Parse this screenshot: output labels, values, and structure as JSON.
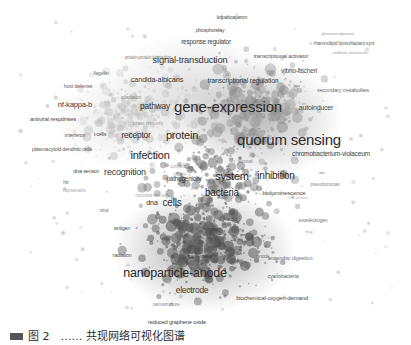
{
  "figure": {
    "kind": "term-co-occurrence-network",
    "background_color": "#ffffff",
    "node_color_light": "#c9c9c9",
    "node_color_mid": "#9a9a9a",
    "node_color_dark": "#5e5e5e",
    "label_color": "#2b2b2b",
    "caption": "图 2　…… 共现网络可视化图谱"
  },
  "chart_data": {
    "type": "scatter",
    "title": "",
    "subtitle": "",
    "xlabel": "",
    "ylabel": "",
    "xlim": [
      0,
      411
    ],
    "ylim": [
      0,
      318
    ],
    "grid": false,
    "legend": "none",
    "note": "Bibliometric VOSviewer-style term map: greyscale bubbles sized by occurrence, positioned by co-occurrence similarity. Three visually apparent density regions: a light upper-left immunology region, a mid-grey upper-right quorum-sensing region, and a dark lower central nanoparticle / electrode region.",
    "clusters": [
      {
        "name": "immunology-host-response",
        "shade": "light",
        "color": "#c9c9c9"
      },
      {
        "name": "quorum-sensing-gene-regulation",
        "shade": "mid",
        "color": "#9a9a9a"
      },
      {
        "name": "nanoparticle-electrode-bioelectrochemistry",
        "shade": "dark",
        "color": "#5e5e5e"
      }
    ],
    "labels": [
      {
        "text": "kdpabcaperon",
        "x": 232,
        "y": 18,
        "size": 5.2,
        "weight": 400,
        "opacity": 0.85,
        "cluster": 1
      },
      {
        "text": "phosphorelay",
        "x": 210,
        "y": 31,
        "size": 5.2,
        "weight": 400,
        "opacity": 0.85,
        "cluster": 1
      },
      {
        "text": "response regulator",
        "x": 206,
        "y": 42,
        "size": 6.4,
        "weight": 400,
        "opacity": 0.9,
        "cluster": 1
      },
      {
        "text": "protein-protein interaction",
        "x": 148,
        "y": 58,
        "size": 4.6,
        "weight": 400,
        "opacity": 0.55,
        "cluster": 0
      },
      {
        "text": "signal-transduction",
        "x": 190,
        "y": 60,
        "size": 9.4,
        "weight": 400,
        "opacity": 0.95,
        "cluster": 1
      },
      {
        "text": "transcriptional activator",
        "x": 281,
        "y": 57,
        "size": 5.8,
        "weight": 400,
        "opacity": 0.8,
        "cluster": 1
      },
      {
        "text": "pharmacodynamic",
        "x": 338,
        "y": 34,
        "size": 4.4,
        "weight": 400,
        "opacity": 0.45,
        "cluster": 1
      },
      {
        "text": "rhamnolipid biosurfactant synt",
        "x": 344,
        "y": 43,
        "size": 5.0,
        "weight": 400,
        "opacity": 0.75,
        "cluster": 1
      },
      {
        "text": "antibiotic treatments",
        "x": 350,
        "y": 53,
        "size": 4.4,
        "weight": 400,
        "opacity": 0.45,
        "cluster": 1
      },
      {
        "text": "flagellin",
        "x": 101,
        "y": 73,
        "size": 5.0,
        "weight": 400,
        "opacity": 0.7,
        "cluster": 0
      },
      {
        "text": "candida-albicans",
        "x": 157,
        "y": 80,
        "size": 7.4,
        "weight": 400,
        "opacity": 0.9,
        "cluster": 0
      },
      {
        "text": "transcriptional regulation",
        "x": 243,
        "y": 80,
        "size": 7.0,
        "weight": 400,
        "opacity": 0.9,
        "cluster": 1
      },
      {
        "text": "vibrio-fischeri",
        "x": 299,
        "y": 71,
        "size": 6.6,
        "weight": 400,
        "opacity": 0.85,
        "cluster": 1
      },
      {
        "text": "host defense",
        "x": 78,
        "y": 87,
        "size": 5.4,
        "weight": 400,
        "opacity": 0.75,
        "cluster": 0
      },
      {
        "text": "lasr",
        "x": 297,
        "y": 86,
        "size": 4.4,
        "weight": 400,
        "opacity": 0.6,
        "cluster": 1
      },
      {
        "text": "secondary metabolites",
        "x": 343,
        "y": 91,
        "size": 5.6,
        "weight": 400,
        "opacity": 0.7,
        "cluster": 1
      },
      {
        "text": "adaptation",
        "x": 131,
        "y": 98,
        "size": 4.8,
        "weight": 400,
        "opacity": 0.5,
        "cluster": 0
      },
      {
        "text": "nf-kappa-b",
        "x": 75,
        "y": 105,
        "size": 7.6,
        "weight": 400,
        "opacity": 0.92,
        "cluster": 0
      },
      {
        "text": "pathway",
        "x": 155,
        "y": 106,
        "size": 8.4,
        "weight": 400,
        "opacity": 0.95,
        "cluster": 0
      },
      {
        "text": "gene-expression",
        "x": 228,
        "y": 106,
        "size": 15.0,
        "weight": 400,
        "opacity": 1.0,
        "cluster": 1
      },
      {
        "text": "autoinducer",
        "x": 316,
        "y": 107,
        "size": 7.0,
        "weight": 400,
        "opacity": 0.85,
        "cluster": 1
      },
      {
        "text": "antiviral responses",
        "x": 53,
        "y": 119,
        "size": 6.0,
        "weight": 400,
        "opacity": 0.85,
        "cluster": 0
      },
      {
        "text": "innate immunity",
        "x": 148,
        "y": 124,
        "size": 4.8,
        "weight": 400,
        "opacity": 0.4,
        "cluster": 0
      },
      {
        "text": "interferon",
        "x": 75,
        "y": 136,
        "size": 5.4,
        "weight": 400,
        "opacity": 0.75,
        "cluster": 0
      },
      {
        "text": "t-cells",
        "x": 100,
        "y": 135,
        "size": 5.4,
        "weight": 400,
        "opacity": 0.8,
        "cluster": 0
      },
      {
        "text": "receptor",
        "x": 136,
        "y": 135,
        "size": 8.4,
        "weight": 400,
        "opacity": 0.95,
        "cluster": 0
      },
      {
        "text": "protein",
        "x": 182,
        "y": 135,
        "size": 11.0,
        "weight": 400,
        "opacity": 1.0,
        "cluster": 0
      },
      {
        "text": "quorum sensing",
        "x": 289,
        "y": 139,
        "size": 15.0,
        "weight": 400,
        "opacity": 1.0,
        "cluster": 1
      },
      {
        "text": "plasmacytoid dendritic cells",
        "x": 62,
        "y": 150,
        "size": 5.4,
        "weight": 400,
        "opacity": 0.8,
        "cluster": 0
      },
      {
        "text": "infection",
        "x": 150,
        "y": 155,
        "size": 11.0,
        "weight": 400,
        "opacity": 1.0,
        "cluster": 0
      },
      {
        "text": "chromobacterium-violaceum",
        "x": 331,
        "y": 154,
        "size": 6.6,
        "weight": 400,
        "opacity": 0.9,
        "cluster": 1
      },
      {
        "text": "survival",
        "x": 245,
        "y": 162,
        "size": 4.8,
        "weight": 400,
        "opacity": 0.5,
        "cluster": 1
      },
      {
        "text": "complex",
        "x": 178,
        "y": 167,
        "size": 4.6,
        "weight": 400,
        "opacity": 0.4,
        "cluster": 0
      },
      {
        "text": "dna sensor",
        "x": 86,
        "y": 172,
        "size": 5.6,
        "weight": 400,
        "opacity": 0.85,
        "cluster": 0
      },
      {
        "text": "recognition",
        "x": 125,
        "y": 172,
        "size": 9.0,
        "weight": 400,
        "opacity": 0.95,
        "cluster": 0
      },
      {
        "text": "biofilm",
        "x": 180,
        "y": 175,
        "size": 4.8,
        "weight": 400,
        "opacity": 0.4,
        "cluster": 1
      },
      {
        "text": "system",
        "x": 232,
        "y": 176,
        "size": 11.0,
        "weight": 400,
        "opacity": 1.0,
        "cluster": 2
      },
      {
        "text": "inhibition",
        "x": 276,
        "y": 176,
        "size": 10.0,
        "weight": 400,
        "opacity": 1.0,
        "cluster": 1
      },
      {
        "text": "abc",
        "x": 322,
        "y": 173,
        "size": 4.4,
        "weight": 400,
        "opacity": 0.5,
        "cluster": 1
      },
      {
        "text": "pathogenicity",
        "x": 184,
        "y": 179,
        "size": 6.4,
        "weight": 400,
        "opacity": 0.9,
        "cluster": 0
      },
      {
        "text": "hiv",
        "x": 66,
        "y": 183,
        "size": 4.8,
        "weight": 400,
        "opacity": 0.7,
        "cluster": 0
      },
      {
        "text": "pseudomonas",
        "x": 325,
        "y": 184,
        "size": 5.0,
        "weight": 400,
        "opacity": 0.55,
        "cluster": 1
      },
      {
        "text": "hsp sensors",
        "x": 74,
        "y": 191,
        "size": 4.6,
        "weight": 400,
        "opacity": 0.45,
        "cluster": 0
      },
      {
        "text": "bacteria",
        "x": 222,
        "y": 193,
        "size": 10.0,
        "weight": 400,
        "opacity": 1.0,
        "cluster": 2
      },
      {
        "text": "bioluminescence",
        "x": 284,
        "y": 193,
        "size": 6.2,
        "weight": 400,
        "opacity": 0.85,
        "cluster": 1
      },
      {
        "text": "rna viruses",
        "x": 298,
        "y": 198,
        "size": 4.4,
        "weight": 400,
        "opacity": 0.4,
        "cluster": 1
      },
      {
        "text": "microbial fuel cells",
        "x": 152,
        "y": 196,
        "size": 4.6,
        "weight": 400,
        "opacity": 0.4,
        "cluster": 2
      },
      {
        "text": "cells",
        "x": 172,
        "y": 203,
        "size": 10.0,
        "weight": 400,
        "opacity": 1.0,
        "cluster": 2
      },
      {
        "text": "dna",
        "x": 152,
        "y": 203,
        "size": 7.2,
        "weight": 400,
        "opacity": 0.95,
        "cluster": 2
      },
      {
        "text": "virus",
        "x": 104,
        "y": 211,
        "size": 4.8,
        "weight": 400,
        "opacity": 0.65,
        "cluster": 2
      },
      {
        "text": "acid",
        "x": 232,
        "y": 220,
        "size": 5.8,
        "weight": 400,
        "opacity": 0.8,
        "cluster": 2
      },
      {
        "text": "exoelectrogen",
        "x": 313,
        "y": 220,
        "size": 5.0,
        "weight": 400,
        "opacity": 0.65,
        "cluster": 2
      },
      {
        "text": "antigen",
        "x": 122,
        "y": 229,
        "size": 5.4,
        "weight": 400,
        "opacity": 0.8,
        "cluster": 2
      },
      {
        "text": "protein",
        "x": 213,
        "y": 230,
        "size": 5.4,
        "weight": 400,
        "opacity": 0.6,
        "cluster": 2
      },
      {
        "text": "hcg",
        "x": 309,
        "y": 232,
        "size": 4.4,
        "weight": 400,
        "opacity": 0.5,
        "cluster": 2
      },
      {
        "text": "radiation",
        "x": 122,
        "y": 256,
        "size": 5.4,
        "weight": 400,
        "opacity": 0.8,
        "cluster": 2
      },
      {
        "text": "wastewater",
        "x": 200,
        "y": 256,
        "size": 5.0,
        "weight": 400,
        "opacity": 0.55,
        "cluster": 2
      },
      {
        "text": "anode",
        "x": 263,
        "y": 256,
        "size": 5.0,
        "weight": 400,
        "opacity": 0.6,
        "cluster": 2
      },
      {
        "text": "anaerobic digestion",
        "x": 290,
        "y": 259,
        "size": 5.6,
        "weight": 400,
        "opacity": 0.65,
        "cluster": 2
      },
      {
        "text": "nanoparticle-anode",
        "x": 175,
        "y": 273,
        "size": 12.5,
        "weight": 400,
        "opacity": 1.0,
        "cluster": 2
      },
      {
        "text": "cyanobacteria",
        "x": 283,
        "y": 277,
        "size": 5.4,
        "weight": 400,
        "opacity": 0.75,
        "cluster": 2
      },
      {
        "text": "electrode",
        "x": 192,
        "y": 290,
        "size": 8.4,
        "weight": 400,
        "opacity": 0.95,
        "cluster": 2
      },
      {
        "text": "biochemical-oxygen-demand",
        "x": 272,
        "y": 298,
        "size": 6.0,
        "weight": 400,
        "opacity": 0.85,
        "cluster": 2
      },
      {
        "text": "nanostructure",
        "x": 166,
        "y": 305,
        "size": 4.8,
        "weight": 400,
        "opacity": 0.55,
        "cluster": 2
      },
      {
        "text": "reduced graphene oxide",
        "x": 177,
        "y": 323,
        "size": 5.8,
        "weight": 400,
        "opacity": 0.9,
        "cluster": 2
      }
    ],
    "density_blobs": [
      {
        "cx": 195,
        "cy": 95,
        "rx": 95,
        "ry": 62,
        "shade": "#d6d6d6",
        "alpha": 0.55
      },
      {
        "cx": 262,
        "cy": 120,
        "rx": 80,
        "ry": 60,
        "shade": "#b4b4b4",
        "alpha": 0.55
      },
      {
        "cx": 205,
        "cy": 250,
        "rx": 92,
        "ry": 62,
        "shade": "#8e8e8e",
        "alpha": 0.5
      },
      {
        "cx": 120,
        "cy": 120,
        "rx": 70,
        "ry": 48,
        "shade": "#e2e2e2",
        "alpha": 0.5
      }
    ]
  }
}
